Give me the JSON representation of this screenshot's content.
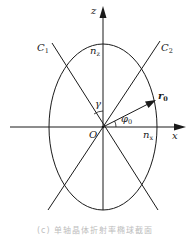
{
  "diagram": {
    "axes": {
      "z_label": "z",
      "x_label": "x",
      "origin_label": "O"
    },
    "lines": {
      "c1_label": "C",
      "c1_sub": "1",
      "c2_label": "C",
      "c2_sub": "2"
    },
    "ellipse": {
      "nz_label": "n",
      "nz_sub": "z",
      "nx_label": "n",
      "nx_sub": "x"
    },
    "vector": {
      "label": "r",
      "sub": "0"
    },
    "angles": {
      "gamma_label": "γ",
      "phi_label": "φ",
      "phi_sub": "0"
    },
    "caption": "(c) 单轴晶体折射率椭球截面",
    "colors": {
      "stroke": "#1a1a1a",
      "background": "#ffffff"
    }
  }
}
